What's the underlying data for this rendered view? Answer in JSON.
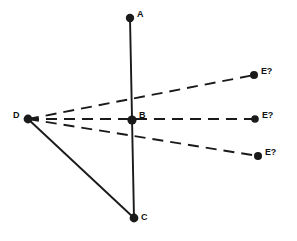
{
  "figure": {
    "type": "geometry-diagram",
    "background_color": "#ffffff",
    "ink_color": "#1a1a1a",
    "width": 297,
    "height": 241
  },
  "points": [
    {
      "id": "A",
      "label": "A",
      "x": 130,
      "y": 18,
      "label_x": 137,
      "label_y": 10,
      "dot_radius": 4.2
    },
    {
      "id": "B",
      "label": "B",
      "x": 132,
      "y": 120,
      "label_x": 139,
      "label_y": 111,
      "dot_radius": 4.6
    },
    {
      "id": "C",
      "label": "C",
      "x": 134,
      "y": 218,
      "label_x": 141,
      "label_y": 213,
      "dot_radius": 4.4
    },
    {
      "id": "D",
      "label": "D",
      "x": 28,
      "y": 119,
      "label_x": 13,
      "label_y": 111,
      "dot_radius": 4.4
    },
    {
      "id": "E1",
      "label": "E?",
      "x": 254,
      "y": 75,
      "label_x": 261,
      "label_y": 67,
      "dot_radius": 4.0
    },
    {
      "id": "E2",
      "label": "E?",
      "x": 255,
      "y": 119,
      "label_x": 262,
      "label_y": 111,
      "dot_radius": 3.8
    },
    {
      "id": "E3",
      "label": "E?",
      "x": 258,
      "y": 156,
      "label_x": 265,
      "label_y": 148,
      "dot_radius": 4.0
    }
  ],
  "segments": [
    {
      "id": "A-C",
      "from": "A",
      "to": "C",
      "style": "solid",
      "width": 1.9
    },
    {
      "id": "D-C",
      "from": "D",
      "to": "C",
      "style": "solid",
      "width": 1.9
    },
    {
      "id": "D-E1",
      "from": "D",
      "to": "E1",
      "style": "dashed",
      "width": 1.9,
      "dash": "11 7"
    },
    {
      "id": "D-E2",
      "from": "D",
      "to": "E2",
      "style": "dashed",
      "width": 1.9,
      "dash": "11 7"
    },
    {
      "id": "D-E3",
      "from": "D",
      "to": "E3",
      "style": "dashed",
      "width": 1.9,
      "dash": "11 7"
    }
  ],
  "chart_data": {
    "type": "scatter",
    "title": "",
    "xlabel": "",
    "ylabel": "",
    "grid": false,
    "legend": "none",
    "categories": [
      "A",
      "B",
      "C",
      "D",
      "E?",
      "E?",
      "E?"
    ],
    "x": [
      130,
      132,
      134,
      28,
      254,
      255,
      258
    ],
    "y": [
      18,
      120,
      218,
      119,
      75,
      119,
      156
    ],
    "annotations": [
      "Vertical solid line A-B-C",
      "Solid line D-C",
      "Dashed ray D to upper E?",
      "Dashed ray D through B to middle E?",
      "Dashed ray D to lower E?"
    ]
  }
}
